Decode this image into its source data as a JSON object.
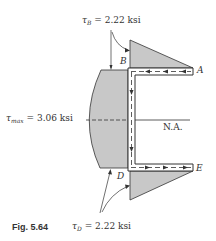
{
  "figure": {
    "caption": "Fig. 5.64",
    "labels": {
      "tau_B": {
        "symbol": "τ",
        "sub": "B",
        "value": "= 2.22 ksi"
      },
      "tau_max": {
        "symbol": "τ",
        "sub": "max",
        "value": "= 3.06 ksi"
      },
      "tau_D": {
        "symbol": "τ",
        "sub": "D",
        "value": "= 2.22 ksi"
      },
      "point_A": "A",
      "point_B": "B",
      "point_D": "D",
      "point_E": "E",
      "neutral_axis": "N.A."
    },
    "colors": {
      "fill": "#c8c8c8",
      "stroke": "#333333"
    }
  }
}
